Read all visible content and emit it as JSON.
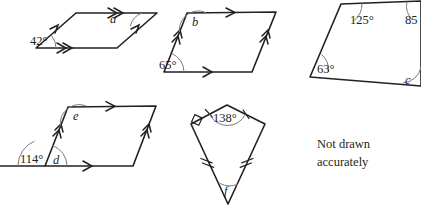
{
  "figure": {
    "note": {
      "line1": "Not drawn",
      "line2": "accurately"
    },
    "shapes": [
      {
        "id": "parallelogram-a",
        "kind": "parallelogram",
        "labels": [
          {
            "id": "angle-42",
            "text": "42°",
            "type": "measure",
            "value": 42,
            "vertex": "bottom-left"
          },
          {
            "id": "angle-a",
            "text": "a",
            "type": "unknown",
            "vertex": "top-right"
          }
        ],
        "side_marks": {
          "horizontal": "double-arrow",
          "slanted": "single-arrow"
        }
      },
      {
        "id": "parallelogram-b",
        "kind": "parallelogram",
        "labels": [
          {
            "id": "angle-b",
            "text": "b",
            "type": "unknown",
            "vertex": "top-left"
          },
          {
            "id": "angle-65",
            "text": "65°",
            "type": "measure",
            "value": 65,
            "vertex": "bottom-left"
          }
        ],
        "side_marks": {
          "horizontal": "single-arrow",
          "slanted": "double-arrow"
        }
      },
      {
        "id": "quadrilateral-c",
        "kind": "quadrilateral",
        "labels": [
          {
            "id": "angle-125",
            "text": "125°",
            "type": "measure",
            "value": 125,
            "vertex": "top-left"
          },
          {
            "id": "angle-85",
            "text": "85",
            "type": "measure",
            "value": 85,
            "vertex": "top-right"
          },
          {
            "id": "angle-63",
            "text": "63°",
            "type": "measure",
            "value": 63,
            "vertex": "left"
          },
          {
            "id": "angle-c",
            "text": "c",
            "type": "unknown",
            "vertex": "bottom-right"
          }
        ]
      },
      {
        "id": "parallelogram-de",
        "kind": "parallelogram-with-extended-base",
        "labels": [
          {
            "id": "angle-e",
            "text": "e",
            "type": "unknown",
            "vertex": "top-left"
          },
          {
            "id": "angle-114",
            "text": "114°",
            "type": "measure",
            "value": 114,
            "vertex": "exterior-bottom-left"
          },
          {
            "id": "angle-d",
            "text": "d",
            "type": "unknown",
            "vertex": "interior-bottom-left"
          }
        ],
        "side_marks": {
          "horizontal": "single-arrow",
          "slanted": "double-arrow"
        }
      },
      {
        "id": "kite-f",
        "kind": "kite",
        "labels": [
          {
            "id": "angle-138",
            "text": "138°",
            "type": "measure",
            "value": 138,
            "vertex": "top"
          },
          {
            "id": "angle-f",
            "text": "f",
            "type": "unknown",
            "vertex": "bottom"
          }
        ],
        "side_marks": {
          "upper": "single-tick",
          "lower": "double-tick"
        },
        "right_angle_vertex": "left"
      }
    ]
  }
}
